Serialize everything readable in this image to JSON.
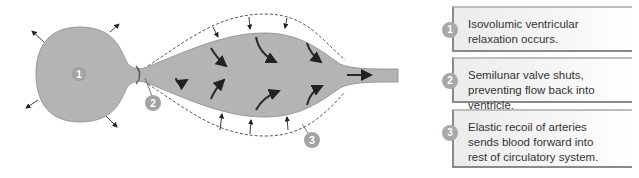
{
  "diagram": {
    "markers": [
      {
        "id": "1",
        "label": "1"
      },
      {
        "id": "2",
        "label": "2"
      },
      {
        "id": "3",
        "label": "3"
      }
    ],
    "colors": {
      "vessel_fill": "#b4b4b4",
      "marker_fill": "#a3a3a3",
      "arrow": "#333333",
      "outline": "#555555"
    }
  },
  "legend": {
    "steps": [
      {
        "number": "1",
        "text": "Isovolumic ventricular relaxation occurs."
      },
      {
        "number": "2",
        "text": "Semilunar valve shuts, preventing flow back into ventricle."
      },
      {
        "number": "3",
        "text": "Elastic recoil of arteries sends blood forward into rest of circulatory system."
      }
    ]
  }
}
